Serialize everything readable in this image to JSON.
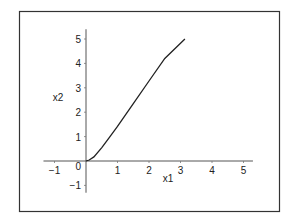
{
  "chart_data": {
    "type": "line",
    "title": "",
    "xlabel": "x1",
    "ylabel": "x2",
    "xlim": [
      -1.35,
      5.3
    ],
    "ylim": [
      -1.3,
      5.4
    ],
    "grid": false,
    "legend": null,
    "x_ticks": [
      -1,
      1,
      2,
      3,
      4,
      5
    ],
    "y_ticks": [
      -1,
      0,
      1,
      2,
      3,
      4,
      5
    ],
    "x_tick_labels": [
      "−1",
      "1",
      "2",
      "3",
      "4",
      "5"
    ],
    "y_tick_labels": [
      "−1",
      "0",
      "1",
      "2",
      "3",
      "4",
      "5"
    ],
    "series": [
      {
        "name": "curve",
        "color": "#222222",
        "x": [
          0,
          0.1,
          0.25,
          0.5,
          0.75,
          1.0,
          1.5,
          2.0,
          2.5,
          3.14
        ],
        "y": [
          0,
          0.04,
          0.17,
          0.55,
          0.98,
          1.42,
          2.35,
          3.28,
          4.2,
          5.0
        ]
      }
    ]
  },
  "frame": {
    "border_color": "#333333"
  }
}
